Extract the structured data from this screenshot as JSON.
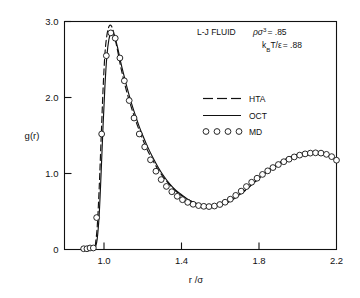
{
  "figure": {
    "background_color": "#ffffff",
    "ink_color": "#111111"
  },
  "annotations": {
    "line1": "L-J FLUID",
    "line1b_base": "ρσ",
    "line1b_sup": "3",
    "line1b_val": "= .85",
    "line2_base": "k",
    "line2_sub": "B",
    "line2_mid": "T/ε",
    "line2_val": "= .88"
  },
  "legend": {
    "items": [
      {
        "key": "HTA",
        "label": "HTA",
        "style": "dashed"
      },
      {
        "key": "OCT",
        "label": "OCT",
        "style": "solid"
      },
      {
        "key": "MD",
        "label": "MD",
        "style": "circles"
      }
    ]
  },
  "axes": {
    "x_title": "r /σ",
    "y_title": "g(r)",
    "x_ticks": [
      "1.0",
      "1.4",
      "1.8",
      "2.2"
    ],
    "x_tick_values": [
      1.0,
      1.4,
      1.8,
      2.2
    ],
    "y_ticks": [
      "0",
      "1.0",
      "2.0",
      "3.0"
    ],
    "y_tick_values": [
      0,
      1.0,
      2.0,
      3.0
    ]
  },
  "chart_data": {
    "type": "line",
    "xlabel": "r /σ",
    "ylabel": "g(r)",
    "xlim": [
      0.88,
      2.2
    ],
    "ylim": [
      0,
      3.0
    ],
    "grid": false,
    "legend_position": "upper-right-inside",
    "series": [
      {
        "name": "HTA",
        "style": "dashed",
        "x": [
          0.955,
          0.965,
          0.975,
          0.985,
          0.995,
          1.005,
          1.015,
          1.025,
          1.035,
          1.045,
          1.055,
          1.07,
          1.085,
          1.1,
          1.12,
          1.14,
          1.16,
          1.18,
          1.2,
          1.22,
          1.25,
          1.28,
          1.31,
          1.34,
          1.37,
          1.4,
          1.43,
          1.46,
          1.49,
          1.52,
          1.55,
          1.58,
          1.62,
          1.66,
          1.7,
          1.74,
          1.78,
          1.82,
          1.86,
          1.9,
          1.94,
          1.98,
          2.02,
          2.06,
          2.1,
          2.14,
          2.18,
          2.2
        ],
        "y": [
          0.05,
          0.3,
          0.8,
          1.45,
          2.1,
          2.58,
          2.82,
          2.93,
          2.95,
          2.9,
          2.8,
          2.62,
          2.42,
          2.25,
          2.05,
          1.88,
          1.72,
          1.58,
          1.45,
          1.33,
          1.18,
          1.05,
          0.94,
          0.85,
          0.77,
          0.71,
          0.66,
          0.62,
          0.59,
          0.575,
          0.57,
          0.575,
          0.6,
          0.65,
          0.72,
          0.8,
          0.89,
          0.98,
          1.06,
          1.13,
          1.19,
          1.235,
          1.262,
          1.272,
          1.268,
          1.25,
          1.21,
          1.185
        ]
      },
      {
        "name": "OCT",
        "style": "solid",
        "x": [
          0.955,
          0.965,
          0.975,
          0.985,
          0.995,
          1.005,
          1.015,
          1.025,
          1.035,
          1.045,
          1.055,
          1.07,
          1.085,
          1.1,
          1.12,
          1.14,
          1.16,
          1.18,
          1.2,
          1.22,
          1.25,
          1.28,
          1.31,
          1.34,
          1.37,
          1.4,
          1.43,
          1.46,
          1.49,
          1.52,
          1.55,
          1.58,
          1.62,
          1.66,
          1.7,
          1.74,
          1.78,
          1.82,
          1.86,
          1.9,
          1.94,
          1.98,
          2.02,
          2.06,
          2.1,
          2.14,
          2.18,
          2.2
        ],
        "y": [
          0.02,
          0.14,
          0.45,
          1.0,
          1.62,
          2.16,
          2.55,
          2.76,
          2.845,
          2.85,
          2.8,
          2.66,
          2.48,
          2.32,
          2.12,
          1.94,
          1.78,
          1.63,
          1.5,
          1.38,
          1.22,
          1.08,
          0.96,
          0.86,
          0.78,
          0.72,
          0.665,
          0.625,
          0.595,
          0.578,
          0.572,
          0.578,
          0.603,
          0.652,
          0.722,
          0.805,
          0.893,
          0.982,
          1.062,
          1.132,
          1.19,
          1.235,
          1.262,
          1.272,
          1.268,
          1.25,
          1.21,
          1.185
        ]
      },
      {
        "name": "MD",
        "style": "circles",
        "x": [
          0.895,
          0.912,
          0.928,
          0.945,
          0.962,
          0.988,
          1.012,
          1.035,
          1.058,
          1.082,
          1.105,
          1.13,
          1.155,
          1.182,
          1.21,
          1.24,
          1.268,
          1.295,
          1.322,
          1.35,
          1.378,
          1.405,
          1.432,
          1.46,
          1.488,
          1.515,
          1.542,
          1.57,
          1.598,
          1.625,
          1.652,
          1.68,
          1.708,
          1.735,
          1.762,
          1.79,
          1.818,
          1.845,
          1.872,
          1.9,
          1.928,
          1.955,
          1.982,
          2.01,
          2.038,
          2.065,
          2.092,
          2.12,
          2.148,
          2.175,
          2.2
        ],
        "y": [
          0.01,
          0.01,
          0.02,
          0.02,
          0.42,
          1.52,
          2.55,
          2.85,
          2.78,
          2.52,
          2.22,
          1.96,
          1.73,
          1.52,
          1.35,
          1.18,
          1.03,
          0.92,
          0.83,
          0.76,
          0.7,
          0.655,
          0.62,
          0.595,
          0.578,
          0.568,
          0.565,
          0.572,
          0.592,
          0.622,
          0.662,
          0.712,
          0.768,
          0.828,
          0.885,
          0.938,
          0.988,
          1.035,
          1.078,
          1.118,
          1.155,
          1.188,
          1.218,
          1.242,
          1.258,
          1.268,
          1.272,
          1.268,
          1.252,
          1.222,
          1.175
        ]
      }
    ]
  }
}
